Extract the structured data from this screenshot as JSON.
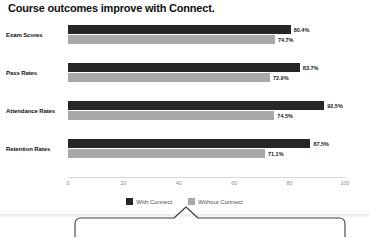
{
  "chart_data": {
    "type": "bar",
    "orientation": "horizontal",
    "title": "Course outcomes improve with Connect.",
    "categories": [
      "Exam Scores",
      "Pass Rates",
      "Attendance Rates",
      "Retention Rates"
    ],
    "series": [
      {
        "name": "With Connect",
        "color": "#262626",
        "values": [
          80.4,
          83.7,
          92.5,
          87.5
        ],
        "labels": [
          "80.4%",
          "83.7%",
          "92.5%",
          "87.5%"
        ]
      },
      {
        "name": "Without Connect",
        "color": "#a8a8a8",
        "values": [
          74.7,
          72.9,
          74.5,
          71.1
        ],
        "labels": [
          "74.7%",
          "72.9%",
          "74.5%",
          "71.1%"
        ]
      }
    ],
    "xlabel": "",
    "ylabel": "",
    "xlim": [
      0,
      100
    ],
    "xticks": [
      0,
      20,
      40,
      60,
      80,
      100
    ],
    "xtick_labels": [
      "0",
      "20",
      "40",
      "60",
      "80",
      "100"
    ],
    "grid": false,
    "legend_position": "bottom"
  },
  "legend": {
    "items": [
      {
        "label": "With Connect",
        "color": "#262626"
      },
      {
        "label": "Without Connect",
        "color": "#a8a8a8"
      }
    ]
  },
  "callout": {
    "stroke": "#3d3d3d"
  }
}
